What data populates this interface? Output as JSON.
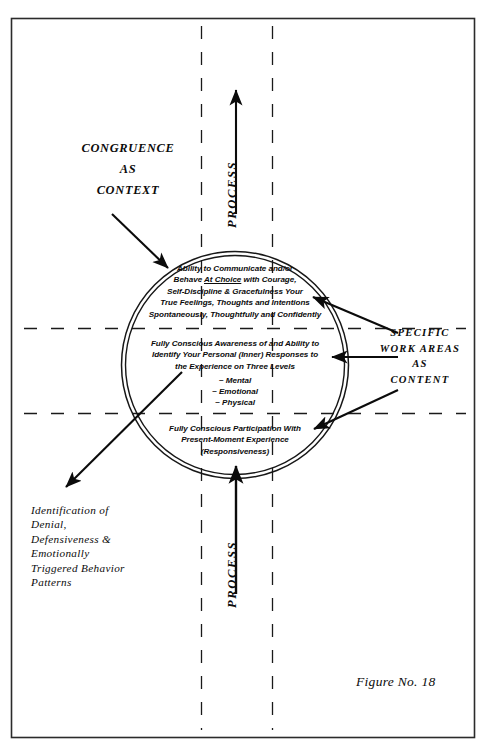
{
  "figure": {
    "caption": "Figure No. 18",
    "border_color": "#2b2b2b",
    "ink_color": "#0b0b0b"
  },
  "labels": {
    "congruence": {
      "line1": "CONGRUENCE",
      "line2": "AS",
      "line3": "CONTEXT"
    },
    "specific_work_areas": {
      "line1": "SPECIFIC",
      "line2": "WORK AREAS",
      "line3": "AS",
      "line4": "CONTENT"
    },
    "identification": {
      "line1": "Identification of",
      "line2": "Denial,",
      "line3": "Defensiveness &",
      "line4": "Emotionally",
      "line5": "Triggered Behavior",
      "line6": "Patterns"
    },
    "process_top": "PROCESS",
    "process_bottom": "PROCESS"
  },
  "circle": {
    "band_top": {
      "line1_a": "Ability to Communicate and/or",
      "line2_a": "Behave ",
      "line2_u": "At Choice",
      "line2_b": " with Courage,",
      "line3": "Self-Discipline & Gracefulness Your",
      "line4": "True Feelings, Thoughts and Intentions",
      "line5": "Spontaneously, Thoughtfully and Confidently"
    },
    "band_middle": {
      "line1": "Fully Conscious Awareness of and Ability to",
      "line2": "Identify Your Personal (Inner) Responses to",
      "line3": "the Experience on Three Levels",
      "levels": [
        "~ Mental",
        "~ Emotional",
        "~ Physical"
      ]
    },
    "band_bottom": {
      "line1": "Fully Conscious Participation With",
      "line2": "Present-Moment Experience",
      "line3": "(Responsiveness)"
    }
  },
  "icons": {
    "arrow_process_up_top": "arrow-up-icon",
    "arrow_process_up_bottom": "arrow-up-icon",
    "arrow_congruence": "arrow-down-right-icon",
    "arrow_identification": "arrow-down-left-icon",
    "arrow_work_top": "arrow-left-icon",
    "arrow_work_middle": "arrow-left-icon",
    "arrow_work_bottom": "arrow-up-left-icon"
  }
}
